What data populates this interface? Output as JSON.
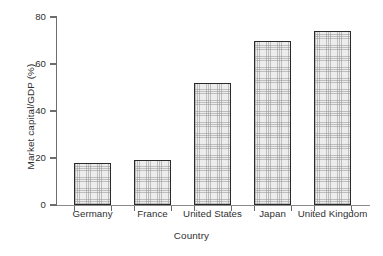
{
  "chart_data": {
    "type": "bar",
    "title": "",
    "xlabel": "Country",
    "ylabel": "Market capital/GDP (%)",
    "categories": [
      "Germany",
      "France",
      "United States",
      "Japan",
      "United Kingdom"
    ],
    "values": [
      18,
      19,
      52,
      70,
      74
    ],
    "ylim": [
      0,
      80
    ],
    "yticks": [
      0,
      20,
      40,
      60,
      80
    ],
    "ytick_labels": [
      "0",
      "20",
      "40",
      "60",
      "80"
    ],
    "grid": false,
    "legend": null,
    "series": [
      {
        "name": "Market capital/GDP (%)",
        "values": [
          18,
          19,
          52,
          70,
          74
        ]
      }
    ],
    "colors": {
      "bar_fill": "#ededed",
      "bar_border": "#2a2a2a",
      "axis": "#6d6d6d",
      "text": "#2f2f2f",
      "background": "#ffffff"
    },
    "bar_style": "hatched-light-gray"
  }
}
